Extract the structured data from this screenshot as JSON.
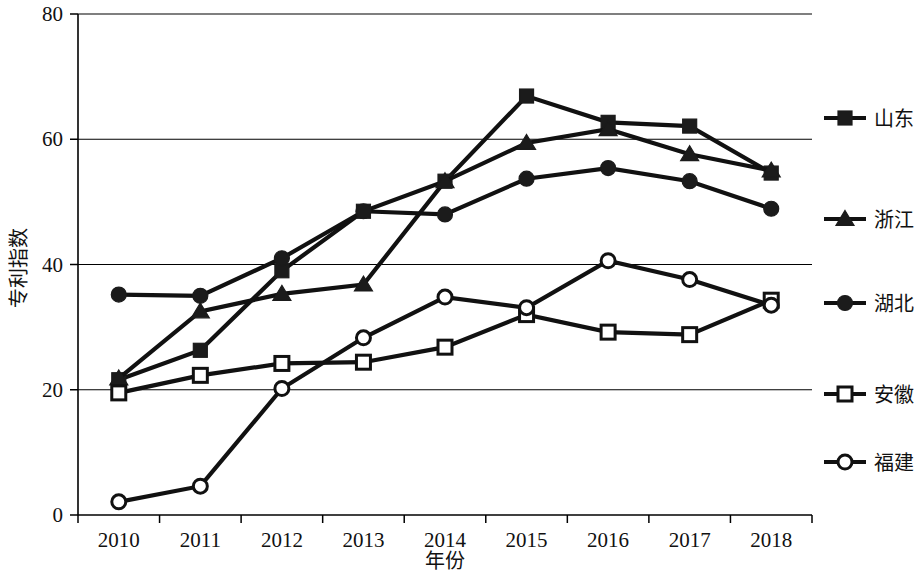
{
  "chart_data": {
    "type": "line",
    "title": "",
    "xlabel": "年份",
    "ylabel": "专利指数",
    "categories": [
      "2010",
      "2011",
      "2012",
      "2013",
      "2014",
      "2015",
      "2016",
      "2017",
      "2018"
    ],
    "x": [
      2010,
      2011,
      2012,
      2013,
      2014,
      2015,
      2016,
      2017,
      2018
    ],
    "ylim": [
      0,
      80
    ],
    "yticks": [
      0,
      20,
      40,
      60,
      80
    ],
    "grid": "horizontal",
    "legend_position": "right",
    "series": [
      {
        "name": "山东",
        "marker": "filled-square",
        "values": [
          21.6,
          26.3,
          39.0,
          48.5,
          53.3,
          66.9,
          62.7,
          62.1,
          54.6
        ]
      },
      {
        "name": "浙江",
        "marker": "filled-triangle",
        "values": [
          21.8,
          32.5,
          35.3,
          36.8,
          53.3,
          59.4,
          61.6,
          57.6,
          55.0
        ]
      },
      {
        "name": "湖北",
        "marker": "filled-circle",
        "values": [
          35.2,
          35.0,
          41.0,
          48.5,
          48.0,
          53.7,
          55.4,
          53.3,
          48.9
        ]
      },
      {
        "name": "安徽",
        "marker": "open-square",
        "values": [
          19.5,
          22.3,
          24.2,
          24.4,
          26.8,
          32.0,
          29.2,
          28.8,
          34.3
        ]
      },
      {
        "name": "福建",
        "marker": "open-circle",
        "values": [
          2.1,
          4.6,
          20.2,
          28.3,
          34.8,
          33.1,
          40.6,
          37.6,
          33.5
        ]
      }
    ]
  },
  "axes": {
    "y_tick_labels": [
      "0",
      "20",
      "40",
      "60",
      "80"
    ],
    "x_tick_labels": [
      "2010",
      "2011",
      "2012",
      "2013",
      "2014",
      "2015",
      "2016",
      "2017",
      "2018"
    ],
    "y_axis_title": "专利指数",
    "x_axis_title": "年份"
  },
  "legend": {
    "items": [
      {
        "label": "山东",
        "marker": "filled-square"
      },
      {
        "label": "浙江",
        "marker": "filled-triangle"
      },
      {
        "label": "湖北",
        "marker": "filled-circle"
      },
      {
        "label": "安徽",
        "marker": "open-square"
      },
      {
        "label": "福建",
        "marker": "open-circle"
      }
    ]
  },
  "colors": {
    "line": "#111111",
    "grid": "#000000",
    "background": "#ffffff",
    "text": "#111111"
  }
}
